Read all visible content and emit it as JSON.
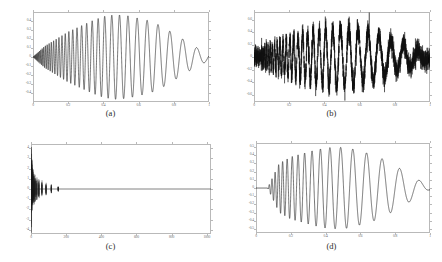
{
  "figure": {
    "title": "",
    "panels": [
      {
        "id": "a",
        "caption": "(a)",
        "chart_data": {
          "type": "line",
          "title": "",
          "xlabel": "",
          "ylabel": "",
          "xlim": [
            0,
            1
          ],
          "ylim": [
            -0.5,
            0.5
          ],
          "grid": false,
          "legend": "none",
          "xticks": [
            "0",
            "0.2",
            "0.4",
            "0.6",
            "0.8",
            "1"
          ],
          "xtickvals": [
            0,
            0.2,
            0.4,
            0.6,
            0.8,
            1
          ],
          "yticks": [
            "0.4",
            "0.3",
            "0.2",
            "0.1",
            "0",
            "-0.1",
            "-0.2",
            "-0.3",
            "-0.4"
          ],
          "ytickvals": [
            0.4,
            0.3,
            0.2,
            0.1,
            0,
            -0.1,
            -0.2,
            -0.3,
            -0.4
          ],
          "series": [
            {
              "name": "clean-chirp",
              "description": "Decreasing-frequency chirp, amplitude envelope growing then decaying",
              "color": "#1a1a1a",
              "signal": {
                "kind": "chirp",
                "amp_env": [
                  0.0,
                  0.12,
                  0.2,
                  0.28,
                  0.34,
                  0.4,
                  0.45,
                  0.47,
                  0.46,
                  0.43,
                  0.4,
                  0.34,
                  0.26,
                  0.18,
                  0.1,
                  0.04
                ],
                "freq_hz_start": 260,
                "freq_hz_end": 3,
                "phase": 0
              }
            }
          ]
        }
      },
      {
        "id": "b",
        "caption": "(b)",
        "chart_data": {
          "type": "line",
          "title": "",
          "xlabel": "",
          "ylabel": "",
          "xlim": [
            0,
            1
          ],
          "ylim": [
            -0.72,
            0.72
          ],
          "grid": false,
          "legend": "none",
          "xticks": [
            "0",
            "0.2",
            "0.4",
            "0.6",
            "0.8",
            "1"
          ],
          "xtickvals": [
            0,
            0.2,
            0.4,
            0.6,
            0.8,
            1
          ],
          "yticks": [
            "0.6",
            "0.4",
            "0.2",
            "0",
            "-0.2",
            "-0.4",
            "-0.6"
          ],
          "ytickvals": [
            0.6,
            0.4,
            0.2,
            0,
            -0.2,
            -0.4,
            -0.6
          ],
          "series": [
            {
              "name": "noisy-chirp",
              "description": "Same chirp corrupted with additive white Gaussian noise",
              "color": "#101010",
              "signal": {
                "kind": "chirp+noise",
                "noise_sigma": 0.085,
                "amp_env": [
                  0.0,
                  0.12,
                  0.2,
                  0.28,
                  0.34,
                  0.4,
                  0.45,
                  0.47,
                  0.46,
                  0.43,
                  0.4,
                  0.34,
                  0.26,
                  0.18,
                  0.1,
                  0.04
                ],
                "freq_hz_start": 260,
                "freq_hz_end": 3,
                "phase": 0
              }
            }
          ]
        }
      },
      {
        "id": "c",
        "caption": "(c)",
        "chart_data": {
          "type": "line",
          "title": "",
          "xlabel": "",
          "ylabel": "",
          "xlim": [
            0,
            1024
          ],
          "ylim": [
            -4.4,
            4.4
          ],
          "grid": false,
          "legend": "none",
          "xticks": [
            "0",
            "200",
            "400",
            "600",
            "800",
            "1000"
          ],
          "xtickvals": [
            0,
            200,
            400,
            600,
            800,
            1000
          ],
          "yticks": [
            "4",
            "3",
            "2",
            "1",
            "0",
            "-1",
            "-2",
            "-3",
            "-4"
          ],
          "ytickvals": [
            4,
            3,
            2,
            1,
            0,
            -1,
            -2,
            -3,
            -4
          ],
          "series": [
            {
              "name": "transform-coefficients",
              "description": "Sparse transform coefficients: large spike near index 0, decaying clusters up to ~index 160, near-zero beyond",
              "color": "#1a1a1a",
              "spikes": [
                {
                  "x": 2,
                  "ymin": -4.3,
                  "ymax": 4.3
                },
                {
                  "x": 5,
                  "ymin": -2.6,
                  "ymax": 2.9
                },
                {
                  "x": 8,
                  "ymin": -2.2,
                  "ymax": 2.4
                },
                {
                  "x": 12,
                  "ymin": -1.9,
                  "ymax": 2.0
                },
                {
                  "x": 17,
                  "ymin": -1.6,
                  "ymax": 1.7
                },
                {
                  "x": 24,
                  "ymin": -1.4,
                  "ymax": 1.5
                },
                {
                  "x": 33,
                  "ymin": -1.2,
                  "ymax": 1.2
                },
                {
                  "x": 45,
                  "ymin": -1.0,
                  "ymax": 1.0
                },
                {
                  "x": 62,
                  "ymin": -0.8,
                  "ymax": 0.85
                },
                {
                  "x": 85,
                  "ymin": -0.62,
                  "ymax": 0.62
                },
                {
                  "x": 115,
                  "ymin": -0.45,
                  "ymax": 0.45
                },
                {
                  "x": 155,
                  "ymin": -0.3,
                  "ymax": 0.3
                }
              ],
              "baseline": 0
            }
          ]
        }
      },
      {
        "id": "d",
        "caption": "(d)",
        "chart_data": {
          "type": "line",
          "title": "",
          "xlabel": "",
          "ylabel": "",
          "xlim": [
            0,
            1
          ],
          "ylim": [
            -0.55,
            0.55
          ],
          "grid": false,
          "legend": "none",
          "xticks": [
            "0",
            "0.2",
            "0.4",
            "0.6",
            "0.8",
            "1"
          ],
          "xtickvals": [
            0,
            0.2,
            0.4,
            0.6,
            0.8,
            1
          ],
          "yticks": [
            "0.5",
            "0.4",
            "0.3",
            "0.2",
            "0.1",
            "0",
            "-0.1",
            "-0.2",
            "-0.3",
            "-0.4",
            "-0.5"
          ],
          "ytickvals": [
            0.5,
            0.4,
            0.3,
            0.2,
            0.1,
            0,
            -0.1,
            -0.2,
            -0.3,
            -0.4,
            -0.5
          ],
          "series": [
            {
              "name": "denoised-reconstruction",
              "description": "Reconstructed chirp after thresholding; flat near zero at the very start, then recovers the oscillation",
              "color": "#1a1a1a",
              "signal": {
                "kind": "chirp-reconstructed",
                "flat_until_x": 0.035,
                "amp_env": [
                  0.0,
                  0.0,
                  0.3,
                  0.38,
                  0.42,
                  0.46,
                  0.49,
                  0.5,
                  0.49,
                  0.45,
                  0.41,
                  0.35,
                  0.27,
                  0.19,
                  0.1,
                  0.02
                ],
                "freq_hz_start": 180,
                "freq_hz_end": 3,
                "phase": 0
              }
            }
          ]
        }
      }
    ]
  }
}
